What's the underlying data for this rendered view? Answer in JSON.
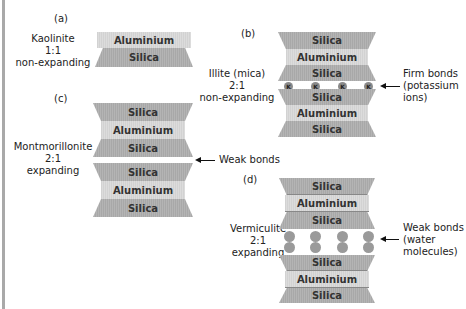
{
  "panels": {
    "a": {
      "tag": "(a)",
      "mineral": "Kaolinite",
      "ratio": "1:1",
      "type": "non-expanding",
      "layers": [
        "Aluminium",
        "Silica"
      ]
    },
    "b": {
      "tag": "(b)",
      "mineral": "Illite (mica)",
      "ratio": "2:1",
      "type": "non-expanding",
      "layers": [
        "Silica",
        "Aluminium",
        "Silica",
        "Silica",
        "Aluminium",
        "Silica"
      ],
      "ion_label": "K",
      "bond_label": [
        "Firm bonds",
        "(potassium",
        "ions)"
      ]
    },
    "c": {
      "tag": "(c)",
      "mineral": "Montmorillonite",
      "ratio": "2:1",
      "type": "expanding",
      "layers": [
        "Silica",
        "Aluminium",
        "Silica",
        "Silica",
        "Aluminium",
        "Silica"
      ],
      "bond_label": "Weak bonds"
    },
    "d": {
      "tag": "(d)",
      "mineral": "Vermiculite",
      "ratio": "2:1",
      "type": "expanding",
      "layers": [
        "Silica",
        "Aluminium",
        "Silica",
        "Silica",
        "Aluminium",
        "Silica"
      ],
      "bond_label": [
        "Weak bonds",
        "(water",
        "molecules)"
      ]
    }
  },
  "colors": {
    "silica": "#adadad",
    "aluminium": "#d6d6d6",
    "ion": "#8a8a8a",
    "water": "#9a9a9a"
  }
}
